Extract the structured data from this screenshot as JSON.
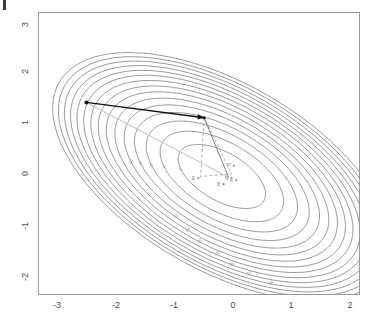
{
  "figure": {
    "title": "",
    "background": "#ffffff",
    "frame_color": "#9a9a9a"
  },
  "corner_mark": {
    "name": "top-left-tick-mark",
    "color": "#3c3c3c"
  },
  "axes": {
    "x": {
      "label": "",
      "ticks": [
        "-3",
        "-2",
        "-1",
        "0",
        "1",
        "2"
      ],
      "tick_values": [
        -3,
        -2,
        -1,
        0,
        1,
        2
      ],
      "range": [
        -3.35,
        2.25
      ]
    },
    "y": {
      "label": "",
      "ticks": [
        "3",
        "2",
        "1",
        "0",
        "-1",
        "-2"
      ],
      "tick_values": [
        3,
        2,
        1,
        0,
        -1,
        -2
      ],
      "range": [
        -2.25,
        3.25
      ],
      "rotated_labels": true
    }
  },
  "chart_data": {
    "type": "line",
    "subtype": "contour",
    "title": "",
    "xlabel": "",
    "ylabel": "",
    "xlim": [
      -3.35,
      2.25
    ],
    "ylim": [
      -2.25,
      3.25
    ],
    "grid": false,
    "legend": "none",
    "contour": {
      "description": "Elliptical contours of a convex quadratic function",
      "center": [
        -0.15,
        0.05
      ],
      "level_labels": [
        "2",
        "4",
        "6",
        "8",
        "10",
        "12",
        "14",
        "16",
        "18",
        "20",
        "22",
        "24",
        "26",
        "28",
        "30"
      ],
      "levels": [
        2,
        4,
        6,
        8,
        10,
        12,
        14,
        16,
        18,
        20,
        22,
        24,
        26,
        28,
        30
      ],
      "line_color": "#6e6e6e",
      "label_color": "#8a8a8a",
      "ellipse_rotation_deg": -35,
      "ellipse_ratio": 0.52
    },
    "annotations": {
      "black_arrow": {
        "name": "search-step-arrow",
        "from": [
          -2.52,
          1.5
        ],
        "to": [
          -0.46,
          1.2
        ],
        "color": "#111111"
      },
      "gray_solid_path": {
        "name": "newton-step-path",
        "points": [
          [
            -0.46,
            1.2
          ],
          [
            -0.03,
            0.03
          ]
        ],
        "color": "#707070"
      },
      "gray_dashed_path": {
        "name": "gradient-step-path",
        "points": [
          [
            -0.46,
            1.2
          ],
          [
            -0.52,
            0.05
          ],
          [
            0.02,
            0.1
          ],
          [
            -0.46,
            1.2
          ]
        ],
        "color": "#9b9b9b"
      },
      "light_gray_path": {
        "name": "initial-direction-path",
        "points": [
          [
            -2.52,
            1.5
          ],
          [
            -0.62,
            0.38
          ],
          [
            -0.03,
            0.03
          ]
        ],
        "color": "#c9c9c9"
      },
      "point_labels": [
        {
          "text": "E",
          "x": -0.56,
          "y": 0.02
        },
        {
          "text": "P",
          "x": 0.06,
          "y": 0.26
        },
        {
          "text": "N",
          "x": 0.02,
          "y": 0.02
        },
        {
          "text": "B",
          "x": -0.12,
          "y": -0.1
        },
        {
          "text": "A",
          "x": 0.1,
          "y": -0.02
        }
      ],
      "point_label_color": "#8a8a8a"
    }
  }
}
